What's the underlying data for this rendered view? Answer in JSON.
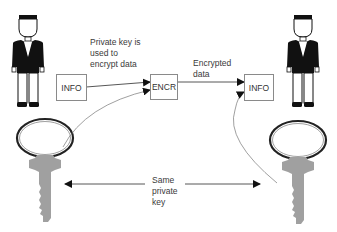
{
  "diagram": {
    "type": "symmetric-encryption",
    "nodes": {
      "sender_info": {
        "label": "INFO"
      },
      "encryptor": {
        "label": "ENCR"
      },
      "receiver_info": {
        "label": "INFO"
      }
    },
    "annotations": {
      "private_key_note": [
        "Private key is",
        "used to",
        "encrypt data"
      ],
      "encrypted_note": [
        "Encrypted",
        "data"
      ],
      "same_key_note": [
        "Same",
        "private",
        "key"
      ]
    },
    "actors": [
      {
        "name": "sender",
        "icon": "person-icon"
      },
      {
        "name": "receiver",
        "icon": "person-icon"
      }
    ],
    "keys": [
      {
        "name": "sender-key",
        "icon": "key-icon"
      },
      {
        "name": "receiver-key",
        "icon": "key-icon"
      }
    ],
    "edges": [
      {
        "from": "sender_info",
        "to": "encryptor"
      },
      {
        "from": "sender-key",
        "to": "encryptor"
      },
      {
        "from": "encryptor",
        "to": "receiver_info"
      },
      {
        "from": "receiver-key",
        "to": "receiver_info"
      },
      {
        "from": "same_key_note",
        "to": "sender-key"
      },
      {
        "from": "same_key_note",
        "to": "receiver-key"
      }
    ],
    "colors": {
      "line": "#555555",
      "box_border": "#8a8a8a",
      "key_fill": "#9c9c9c",
      "person_fill": "#111111"
    }
  }
}
